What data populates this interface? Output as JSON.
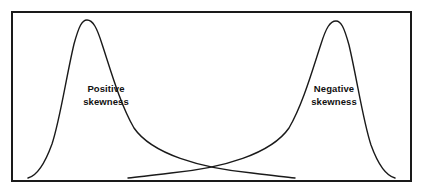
{
  "figure": {
    "background_color": "#ffffff",
    "frame": {
      "name": "plot-border",
      "stroke_color": "#1a1a1a",
      "stroke_width": 2,
      "x": 11,
      "y": 11,
      "width": 401,
      "height": 171
    }
  },
  "labels": {
    "positive": {
      "line1": "Positive",
      "line2": "skewness"
    },
    "negative": {
      "line1": "Negative",
      "line2": "skewness"
    }
  },
  "chart_data": {
    "type": "line",
    "title": "",
    "subtitle": "",
    "xlabel": "",
    "ylabel": "",
    "grid": false,
    "legend_position": "inline-annotations",
    "axis_ticks": [],
    "tick_labels": [],
    "xlim": [
      11,
      412
    ],
    "ylim": [
      11,
      182
    ],
    "annotations": [
      {
        "text": "Positive skewness",
        "x": 106,
        "y": 96,
        "bold": true,
        "series": "positive-skew-curve"
      },
      {
        "text": "Negative skewness",
        "x": 334,
        "y": 96,
        "bold": true,
        "series": "negative-skew-curve"
      }
    ],
    "crossing_point": {
      "x": 207,
      "y": 145
    },
    "series": [
      {
        "name": "positive-skew-curve",
        "skew": "positive",
        "stroke_color": "#1a1a1a",
        "stroke_width": 1.4,
        "peak": {
          "x": 85,
          "y": 20
        },
        "start": {
          "x": 28,
          "y": 178
        },
        "end": {
          "x": 295,
          "y": 178
        },
        "path": "M 28,178 C 36,176 44,166 52,144 C 60,120 66,78 74,44 C 79,26 82,20 87,20 C 93,20 97,28 102,44 C 110,68 120,104 134,128 C 152,154 200,168 252,173 C 268,175 284,177 295,178"
      },
      {
        "name": "negative-skew-curve",
        "skew": "negative",
        "stroke_color": "#1a1a1a",
        "stroke_width": 1.4,
        "peak": {
          "x": 337,
          "y": 21
        },
        "start": {
          "x": 128,
          "y": 178
        },
        "end": {
          "x": 395,
          "y": 178
        },
        "path": "M 128,178 C 139,177 155,175 171,173 C 223,168 271,154 289,128 C 303,104 313,68 321,44 C 326,28 330,21 336,21 C 341,21 344,27 349,45 C 357,79 363,121 371,145 C 379,167 387,176 395,178"
      }
    ]
  }
}
